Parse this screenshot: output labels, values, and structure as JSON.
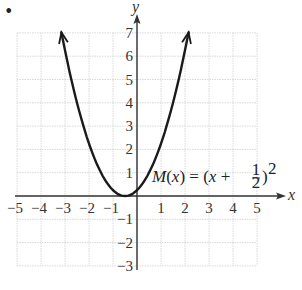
{
  "chart_data": {
    "type": "line",
    "title": "",
    "function_label": "M(x) = (x + 1/2)^2",
    "label_parts": {
      "name": "M",
      "arg": "x",
      "eq": "=",
      "open": "(x +",
      "num": "1",
      "den": "2",
      "close": ")",
      "exp": "2"
    },
    "xlabel": "x",
    "ylabel": "y",
    "xlim": [
      -5,
      5
    ],
    "ylim": [
      -3,
      7
    ],
    "x_ticks": [
      "−5",
      "−4",
      "−3",
      "−2",
      "−1",
      "1",
      "2",
      "3",
      "4",
      "5"
    ],
    "y_ticks": [
      "7",
      "6",
      "5",
      "4",
      "3",
      "2",
      "1",
      "−1",
      "−2",
      "−3"
    ],
    "grid": true,
    "vertex": [
      -0.5,
      0
    ],
    "series": [
      {
        "name": "M(x)",
        "x": [
          -3.15,
          -3,
          -2.5,
          -2,
          -1.5,
          -1,
          -0.5,
          0,
          0.5,
          1,
          1.5,
          2.15
        ],
        "values": [
          7.02,
          6.25,
          4,
          2.25,
          1,
          0.25,
          0,
          0.25,
          1,
          2.25,
          4,
          7.02
        ],
        "arrows": "both ends"
      }
    ]
  },
  "page": {
    "bullet": "•"
  }
}
